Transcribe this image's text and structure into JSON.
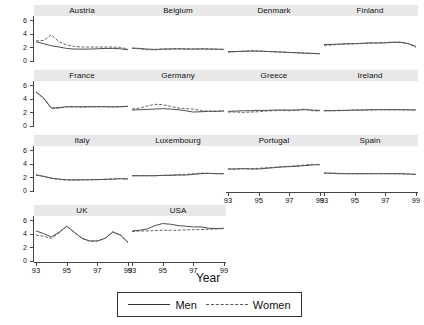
{
  "chart_data": {
    "type": "line",
    "title": "",
    "xlabel": "Year",
    "ylabel": "",
    "xlim": [
      93,
      99
    ],
    "ylim": [
      0,
      6.4
    ],
    "yticks": [
      0,
      2,
      4,
      6
    ],
    "xticks": [
      93,
      95,
      97,
      99
    ],
    "xtick_labels": [
      "93",
      "95",
      "97",
      "99"
    ],
    "ytick_labels": [
      "0",
      "2",
      "4",
      "6"
    ],
    "grid": false,
    "legend_position": "bottom",
    "legend": [
      {
        "name": "Men",
        "style": "solid"
      },
      {
        "name": "Women",
        "style": "dashed"
      }
    ],
    "x": [
      93,
      93.5,
      94,
      94.5,
      95,
      95.5,
      96,
      96.5,
      97,
      97.5,
      98,
      98.5,
      99
    ],
    "panels": [
      {
        "label": "Austria",
        "series": [
          {
            "name": "Men",
            "values": [
              2.8,
              2.5,
              2.2,
              2.0,
              1.8,
              1.7,
              1.7,
              1.7,
              1.75,
              1.8,
              1.8,
              1.75,
              1.6
            ]
          },
          {
            "name": "Women",
            "values": [
              2.9,
              3.0,
              3.8,
              2.8,
              2.3,
              2.1,
              2.0,
              2.0,
              2.0,
              2.0,
              2.0,
              1.95,
              1.7
            ]
          }
        ]
      },
      {
        "label": "Belgium",
        "series": [
          {
            "name": "Men",
            "values": [
              1.85,
              1.8,
              1.7,
              1.65,
              1.7,
              1.7,
              1.72,
              1.7,
              1.7,
              1.72,
              1.7,
              1.68,
              1.65
            ]
          },
          {
            "name": "Women",
            "values": [
              1.8,
              1.75,
              1.6,
              1.6,
              1.7,
              1.75,
              1.78,
              1.75,
              1.72,
              1.75,
              1.72,
              1.7,
              1.65
            ]
          }
        ]
      },
      {
        "label": "Denmark",
        "series": [
          {
            "name": "Men",
            "values": [
              1.3,
              1.35,
              1.35,
              1.4,
              1.4,
              1.35,
              1.3,
              1.25,
              1.2,
              1.15,
              1.1,
              1.05,
              1.0
            ]
          },
          {
            "name": "Women",
            "values": [
              1.25,
              1.3,
              1.4,
              1.45,
              1.4,
              1.35,
              1.3,
              1.25,
              1.2,
              1.15,
              1.1,
              1.05,
              1.0
            ]
          }
        ]
      },
      {
        "label": "Finland",
        "series": [
          {
            "name": "Men",
            "values": [
              2.4,
              2.4,
              2.45,
              2.5,
              2.5,
              2.55,
              2.6,
              2.6,
              2.62,
              2.7,
              2.7,
              2.5,
              2.1
            ]
          },
          {
            "name": "Women",
            "values": [
              2.25,
              2.3,
              2.4,
              2.45,
              2.5,
              2.55,
              2.6,
              2.62,
              2.7,
              2.72,
              2.75,
              2.5,
              1.95
            ]
          }
        ]
      },
      {
        "label": "France",
        "series": [
          {
            "name": "Men",
            "values": [
              5.0,
              4.1,
              2.6,
              2.65,
              2.8,
              2.8,
              2.78,
              2.8,
              2.8,
              2.8,
              2.78,
              2.8,
              2.85
            ]
          },
          {
            "name": "Women",
            "values": [
              5.0,
              4.0,
              2.55,
              2.6,
              2.75,
              2.78,
              2.75,
              2.78,
              2.78,
              2.8,
              2.75,
              2.78,
              2.85
            ]
          }
        ]
      },
      {
        "label": "Germany",
        "series": [
          {
            "name": "Men",
            "values": [
              2.3,
              2.35,
              2.4,
              2.45,
              2.5,
              2.45,
              2.35,
              2.2,
              2.0,
              2.05,
              2.1,
              2.1,
              2.15
            ]
          },
          {
            "name": "Women",
            "values": [
              2.45,
              2.6,
              2.9,
              3.15,
              3.1,
              2.85,
              2.6,
              2.5,
              2.45,
              2.2,
              2.15,
              2.15,
              2.2
            ]
          }
        ]
      },
      {
        "label": "Greece",
        "series": [
          {
            "name": "Men",
            "values": [
              2.1,
              2.15,
              2.2,
              2.2,
              2.25,
              2.25,
              2.3,
              2.3,
              2.3,
              2.3,
              2.35,
              2.3,
              2.25
            ]
          },
          {
            "name": "Women",
            "values": [
              2.0,
              2.0,
              1.95,
              2.0,
              2.05,
              2.15,
              2.2,
              2.25,
              2.2,
              2.3,
              2.45,
              2.2,
              2.15
            ]
          }
        ]
      },
      {
        "label": "Ireland",
        "series": [
          {
            "name": "Men",
            "values": [
              2.2,
              2.2,
              2.25,
              2.25,
              2.3,
              2.3,
              2.35,
              2.35,
              2.35,
              2.35,
              2.35,
              2.35,
              2.3
            ]
          },
          {
            "name": "Women",
            "values": [
              2.2,
              2.2,
              2.2,
              2.25,
              2.3,
              2.3,
              2.3,
              2.35,
              2.35,
              2.35,
              2.35,
              2.3,
              2.3
            ]
          }
        ]
      },
      {
        "label": "Italy",
        "series": [
          {
            "name": "Men",
            "values": [
              2.3,
              2.1,
              1.85,
              1.7,
              1.6,
              1.58,
              1.6,
              1.6,
              1.62,
              1.65,
              1.7,
              1.75,
              1.7
            ]
          },
          {
            "name": "Women",
            "values": [
              2.35,
              2.1,
              1.8,
              1.65,
              1.55,
              1.55,
              1.58,
              1.6,
              1.62,
              1.68,
              1.72,
              1.78,
              1.75
            ]
          }
        ]
      },
      {
        "label": "Luxembourg",
        "series": [
          {
            "name": "Men",
            "values": [
              2.2,
              2.2,
              2.2,
              2.2,
              2.25,
              2.25,
              2.3,
              2.3,
              2.4,
              2.5,
              2.55,
              2.5,
              2.5
            ]
          },
          {
            "name": "Women",
            "values": [
              2.2,
              2.2,
              2.2,
              2.2,
              2.25,
              2.3,
              2.35,
              2.4,
              2.5,
              2.6,
              2.55,
              2.5,
              2.5
            ]
          }
        ]
      },
      {
        "label": "Portugal",
        "series": [
          {
            "name": "Men",
            "values": [
              3.2,
              3.2,
              3.25,
              3.2,
              3.2,
              3.3,
              3.4,
              3.5,
              3.55,
              3.6,
              3.7,
              3.8,
              3.85
            ]
          },
          {
            "name": "Women",
            "values": [
              3.2,
              3.2,
              3.25,
              3.25,
              3.3,
              3.4,
              3.45,
              3.55,
              3.6,
              3.7,
              3.8,
              3.9,
              3.85
            ]
          }
        ]
      },
      {
        "label": "Spain",
        "series": [
          {
            "name": "Men",
            "values": [
              2.6,
              2.55,
              2.5,
              2.5,
              2.5,
              2.5,
              2.5,
              2.5,
              2.5,
              2.5,
              2.5,
              2.45,
              2.4
            ]
          },
          {
            "name": "Women",
            "values": [
              2.55,
              2.6,
              2.55,
              2.5,
              2.5,
              2.5,
              2.5,
              2.52,
              2.5,
              2.5,
              2.48,
              2.45,
              2.4
            ]
          }
        ]
      },
      {
        "label": "UK",
        "series": [
          {
            "name": "Men",
            "values": [
              4.4,
              4.0,
              3.5,
              4.2,
              5.1,
              4.2,
              3.3,
              2.9,
              2.9,
              3.3,
              4.2,
              3.8,
              2.7
            ]
          },
          {
            "name": "Women",
            "values": [
              3.8,
              3.6,
              3.3,
              4.1,
              5.1,
              4.2,
              3.3,
              2.9,
              2.9,
              3.3,
              4.3,
              3.8,
              2.7
            ]
          }
        ]
      },
      {
        "label": "USA",
        "series": [
          {
            "name": "Men",
            "values": [
              4.4,
              4.5,
              4.7,
              5.2,
              5.5,
              5.4,
              5.2,
              5.1,
              5.0,
              5.0,
              4.8,
              4.75,
              4.8
            ]
          },
          {
            "name": "Women",
            "values": [
              4.3,
              4.4,
              4.4,
              4.45,
              4.5,
              4.5,
              4.5,
              4.55,
              4.6,
              4.6,
              4.65,
              4.7,
              4.75
            ]
          }
        ]
      }
    ]
  },
  "colors": {
    "men_line": "#3a3a3a",
    "women_line": "#555555",
    "strip_bg": "#e8e8e8",
    "axis": "#444444"
  }
}
